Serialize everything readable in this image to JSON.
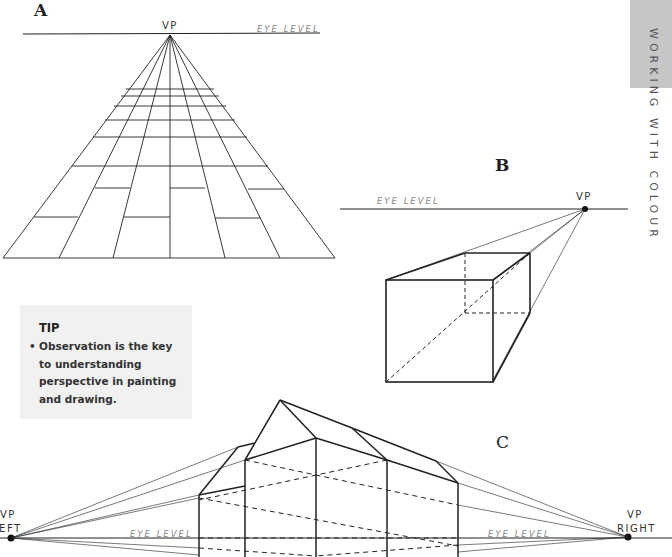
{
  "side_tab": {
    "text": "WORKING WITH COLOUR",
    "color": "#c6c6c6"
  },
  "diagram_a": {
    "letter": "A",
    "vp_label": "VP",
    "eye_level_label": "EYE LEVEL"
  },
  "diagram_b": {
    "letter": "B",
    "vp_label": "VP",
    "eye_level_label": "EYE LEVEL"
  },
  "diagram_c": {
    "letter": "C",
    "vp_left_label_1": "VP",
    "vp_left_label_2": "LEFT",
    "vp_right_label_1": "VP",
    "vp_right_label_2": "RIGHT",
    "eye_level_label_left": "EYE LEVEL",
    "eye_level_label_right": "EYE LEVEL"
  },
  "tip": {
    "title": "TIP",
    "bullet": "•",
    "lines": [
      "Observation is the key",
      "to understanding",
      "perspective in painting",
      "and drawing."
    ]
  }
}
